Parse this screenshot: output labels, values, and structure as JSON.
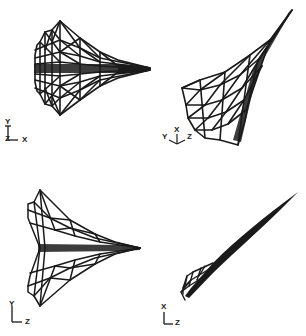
{
  "figure": {
    "panels": [
      {
        "id": "top-left",
        "axes": {
          "vertical": "Y",
          "horizontal": "X",
          "out": "Z"
        },
        "triad_labels": [
          "Y",
          "Z",
          "X"
        ]
      },
      {
        "id": "top-right",
        "axes": {
          "left": "Y",
          "up": "X",
          "right": "Z"
        },
        "triad_labels": [
          "Y",
          "X",
          "Z"
        ]
      },
      {
        "id": "bottom-left",
        "axes": {
          "vertical": "Y",
          "horizontal": "Z"
        },
        "triad_labels": [
          "Y",
          "Z"
        ]
      },
      {
        "id": "bottom-right",
        "axes": {
          "vertical": "X",
          "horizontal": "Z"
        },
        "triad_labels": [
          "X",
          "Z"
        ]
      }
    ],
    "colors": {
      "line": "#1a1a1a",
      "background": "#ffffff"
    }
  }
}
